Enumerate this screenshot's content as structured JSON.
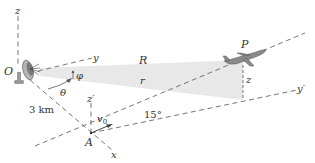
{
  "figure": {
    "labels": {
      "origin": "O",
      "z_axis": "z",
      "y_axis": "y",
      "x_axis": "x",
      "elevation_angle": "φ",
      "azimuth_angle": "θ",
      "distance": "3 km",
      "point_A": "A",
      "z_prime_axis": "z′",
      "y_prime_axis": "y′",
      "velocity": "v",
      "velocity_sub": "0",
      "climb_angle": "15°",
      "slant_range": "R",
      "horizontal_range": "r",
      "altitude": "z",
      "plane": "P"
    },
    "colors": {
      "beam": "#e6e6e6",
      "dashes": "#666666",
      "text": "#333333",
      "plane": "#888888"
    }
  }
}
